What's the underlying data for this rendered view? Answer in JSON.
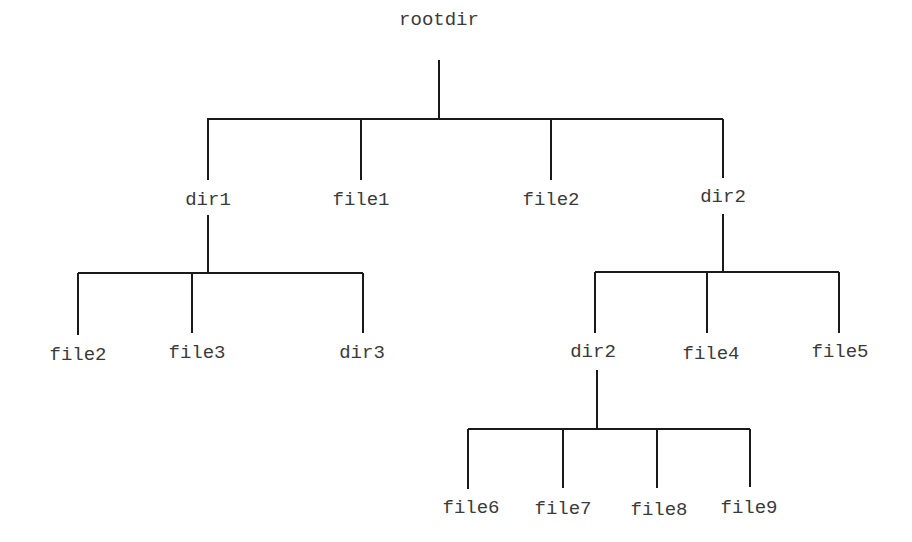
{
  "diagram": {
    "type": "directory-tree",
    "line_color": "#1a1a1a",
    "text_color": "#3a3a3a",
    "nodes": [
      {
        "id": "rootdir",
        "label": "rootdir",
        "x": 439,
        "y": 40
      },
      {
        "id": "dir1",
        "label": "dir1",
        "x": 208,
        "y": 200
      },
      {
        "id": "file1",
        "label": "file1",
        "x": 361,
        "y": 200
      },
      {
        "id": "file2_a",
        "label": "file2",
        "x": 551,
        "y": 200
      },
      {
        "id": "dir2_a",
        "label": "dir2",
        "x": 723,
        "y": 197
      },
      {
        "id": "file2_b",
        "label": "file2",
        "x": 78,
        "y": 355
      },
      {
        "id": "file3",
        "label": "file3",
        "x": 197,
        "y": 353
      },
      {
        "id": "dir3",
        "label": "dir3",
        "x": 362,
        "y": 353
      },
      {
        "id": "dir2_b",
        "label": "dir2",
        "x": 593,
        "y": 352
      },
      {
        "id": "file4",
        "label": "file4",
        "x": 711,
        "y": 354
      },
      {
        "id": "file5",
        "label": "file5",
        "x": 840,
        "y": 352
      },
      {
        "id": "file6",
        "label": "file6",
        "x": 471,
        "y": 508
      },
      {
        "id": "file7",
        "label": "file7",
        "x": 563,
        "y": 509
      },
      {
        "id": "file8",
        "label": "file8",
        "x": 659,
        "y": 510
      },
      {
        "id": "file9",
        "label": "file9",
        "x": 749,
        "y": 508
      }
    ],
    "edges": [
      {
        "parent": "rootdir",
        "children": [
          "dir1",
          "file1",
          "file2_a",
          "dir2_a"
        ]
      },
      {
        "parent": "dir1",
        "children": [
          "file2_b",
          "file3",
          "dir3"
        ]
      },
      {
        "parent": "dir2_a",
        "children": [
          "dir2_b",
          "file4",
          "file5"
        ]
      },
      {
        "parent": "dir2_b",
        "children": [
          "file6",
          "file7",
          "file8",
          "file9"
        ]
      }
    ]
  }
}
